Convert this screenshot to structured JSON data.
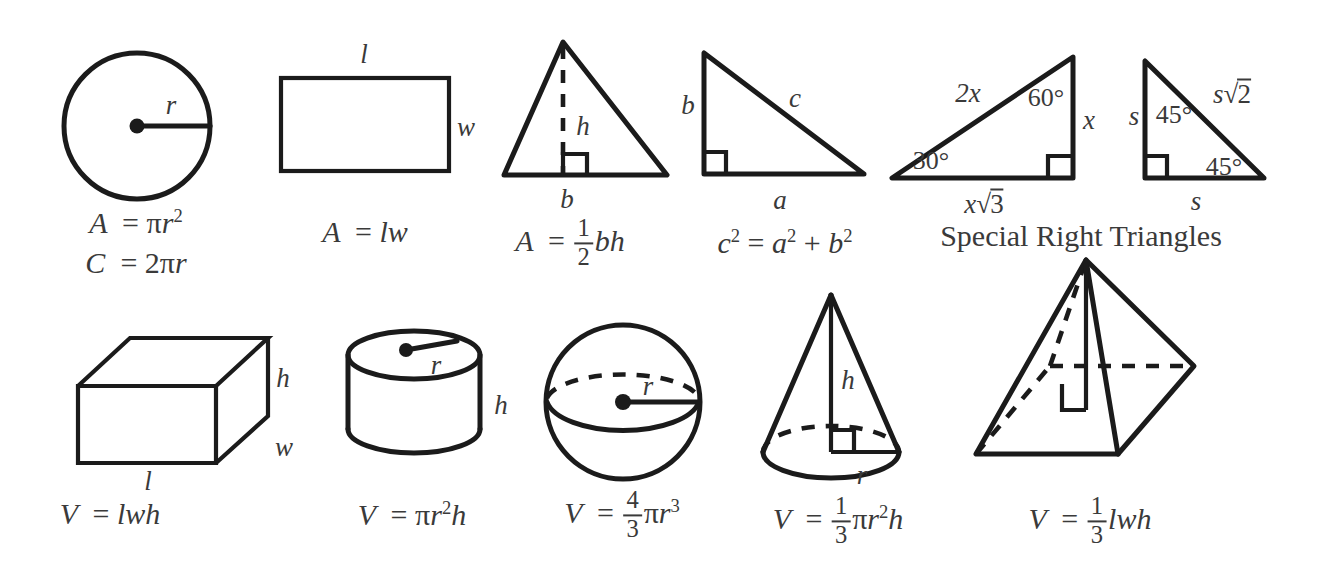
{
  "sheet": {
    "title": "Geometry Formula Reference Sheet",
    "background": "#ffffff",
    "ink": "#1b1b1b",
    "text_color": "#3a3a3a"
  },
  "section_headings": {
    "special_right_triangles": "Special Right Triangles"
  },
  "figures": {
    "circle": {
      "name": "circle",
      "labels": {
        "radius": "r"
      },
      "formulas": {
        "area": "A = πr²",
        "circumference": "C = 2πr"
      },
      "formula_parts": {
        "area_lhs": "A",
        "area_eq": "=",
        "area_pi": "π",
        "area_var": "r",
        "area_exp": "2",
        "circ_lhs": "C",
        "circ_eq": "=",
        "circ_coef": "2",
        "circ_pi": "π",
        "circ_var": "r"
      }
    },
    "rectangle": {
      "name": "rectangle",
      "labels": {
        "length": "l",
        "width": "w"
      },
      "formulas": {
        "area": "A = lw"
      },
      "formula_parts": {
        "lhs": "A",
        "eq": "=",
        "rhs": "lw"
      }
    },
    "triangle": {
      "name": "triangle",
      "labels": {
        "height": "h",
        "base": "b"
      },
      "formulas": {
        "area": "A = ½bh"
      },
      "formula_parts": {
        "lhs": "A",
        "eq": "=",
        "num": "1",
        "den": "2",
        "rhs": "bh"
      }
    },
    "right_triangle": {
      "name": "right-triangle",
      "labels": {
        "leg_vertical": "b",
        "hypotenuse": "c",
        "leg_horizontal": "a"
      },
      "formulas": {
        "pythagorean": "c² = a² + b²"
      },
      "formula_parts": {
        "c": "c",
        "c_exp": "2",
        "eq": "=",
        "a": "a",
        "a_exp": "2",
        "plus": "+",
        "b": "b",
        "b_exp": "2"
      }
    },
    "triangle_30_60_90": {
      "name": "30-60-90-triangle",
      "labels": {
        "hypotenuse": "2x",
        "angle_top": "60°",
        "leg_short": "x",
        "angle_left": "30°",
        "leg_long_var": "x",
        "leg_long_radicand": "3"
      }
    },
    "triangle_45_45_90": {
      "name": "45-45-90-triangle",
      "labels": {
        "leg_left": "s",
        "angle_top": "45°",
        "hypotenuse_var": "s",
        "hypotenuse_radicand": "2",
        "angle_bottom": "45°",
        "leg_bottom": "s"
      }
    },
    "rectangular_prism": {
      "name": "rectangular-prism",
      "labels": {
        "height": "h",
        "width": "w",
        "length": "l"
      },
      "formulas": {
        "volume": "V = lwh"
      },
      "formula_parts": {
        "lhs": "V",
        "eq": "=",
        "rhs": "lwh"
      }
    },
    "cylinder": {
      "name": "cylinder",
      "labels": {
        "radius": "r",
        "height": "h"
      },
      "formulas": {
        "volume": "V = πr²h"
      },
      "formula_parts": {
        "lhs": "V",
        "eq": "=",
        "pi": "π",
        "r": "r",
        "exp": "2",
        "h": "h"
      }
    },
    "sphere": {
      "name": "sphere",
      "labels": {
        "radius": "r"
      },
      "formulas": {
        "volume": "V = 4/3 πr³"
      },
      "formula_parts": {
        "lhs": "V",
        "eq": "=",
        "num": "4",
        "den": "3",
        "pi": "π",
        "r": "r",
        "exp": "3"
      }
    },
    "cone": {
      "name": "cone",
      "labels": {
        "height": "h",
        "radius": "r"
      },
      "formulas": {
        "volume": "V = 1/3 πr²h"
      },
      "formula_parts": {
        "lhs": "V",
        "eq": "=",
        "num": "1",
        "den": "3",
        "pi": "π",
        "r": "r",
        "exp": "2",
        "h": "h"
      }
    },
    "pyramid": {
      "name": "pyramid",
      "labels": {},
      "formulas": {
        "volume": "V = 1/3 lwh"
      },
      "formula_parts": {
        "lhs": "V",
        "eq": "=",
        "num": "1",
        "den": "3",
        "rhs": "lwh"
      }
    }
  }
}
